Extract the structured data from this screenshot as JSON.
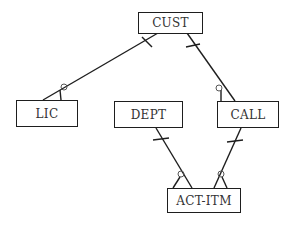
{
  "diagram": {
    "type": "entity-relationship",
    "entities": [
      {
        "id": "cust",
        "label": "CUST"
      },
      {
        "id": "lic",
        "label": "LIC"
      },
      {
        "id": "dept",
        "label": "DEPT"
      },
      {
        "id": "call",
        "label": "CALL"
      },
      {
        "id": "act_itm",
        "label": "ACT-ITM"
      }
    ],
    "relationships": [
      {
        "from": "CUST",
        "to": "LIC",
        "from_cardinality": "one",
        "to_cardinality": "zero-or-many"
      },
      {
        "from": "CUST",
        "to": "CALL",
        "from_cardinality": "one",
        "to_cardinality": "zero-or-many"
      },
      {
        "from": "DEPT",
        "to": "ACT-ITM",
        "from_cardinality": "one",
        "to_cardinality": "zero-or-many"
      },
      {
        "from": "CALL",
        "to": "ACT-ITM",
        "from_cardinality": "one",
        "to_cardinality": "zero-or-many"
      }
    ],
    "colors": {
      "line": "#1e1e1e",
      "text": "#333333",
      "background": "#ffffff"
    }
  }
}
